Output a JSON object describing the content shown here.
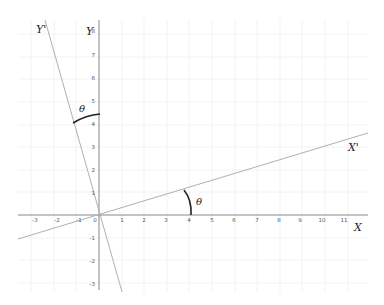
{
  "diagram": {
    "origin_px": [
      99,
      215
    ],
    "unit_px": 22.6,
    "x_axis": {
      "label": "X",
      "ticks": [
        "-3",
        "-2",
        "-1",
        "0",
        "1",
        "2",
        "3",
        "4",
        "5",
        "6",
        "7",
        "8",
        "9",
        "10",
        "11"
      ]
    },
    "y_axis": {
      "label": "Y",
      "ticks": [
        "8",
        "7",
        "6",
        "5",
        "4",
        "3",
        "2",
        "1",
        "-1",
        "-2",
        "-3"
      ]
    },
    "rotated_x_axis": {
      "label": "X'"
    },
    "rotated_y_axis": {
      "label": "Y'"
    },
    "angle_label_1": "θ",
    "angle_label_2": "θ",
    "colors": {
      "axis": "#888888",
      "rotated_axis": "#aaaaaa",
      "arc": "#222222",
      "grid": "#f3f3f3"
    }
  }
}
